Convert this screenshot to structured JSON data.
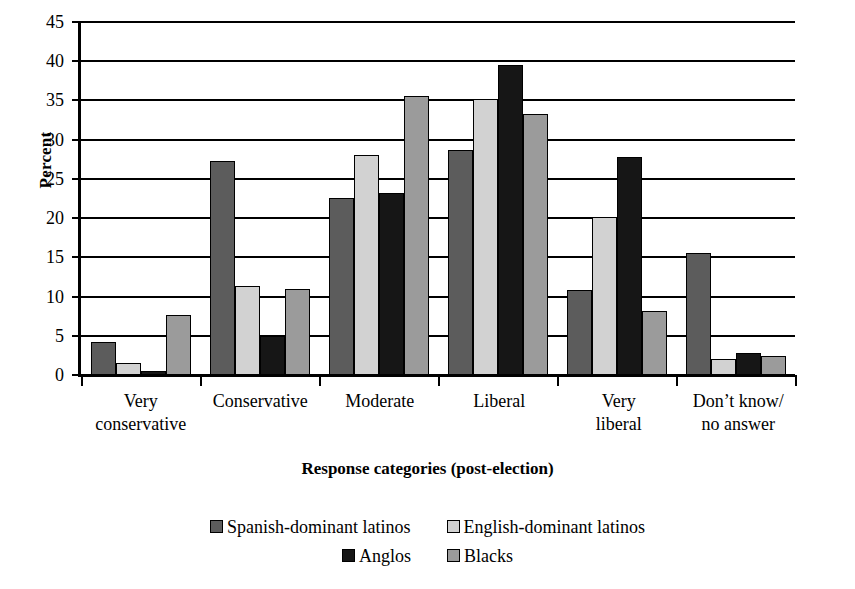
{
  "chart_data": {
    "type": "bar",
    "title": "",
    "xlabel": "Response categories (post-election)",
    "ylabel": "Percent",
    "ylim": [
      0,
      45
    ],
    "ytick_step": 5,
    "yticks": [
      45,
      40,
      35,
      30,
      25,
      20,
      15,
      10,
      5,
      0
    ],
    "grid": true,
    "legend_position": "bottom",
    "categories": [
      "Very\nconservative",
      "Conservative",
      "Moderate",
      "Liberal",
      "Very\nliberal",
      "Don’t know/\nno answer"
    ],
    "category_lines": [
      [
        "Very",
        "conservative"
      ],
      [
        "Conservative",
        ""
      ],
      [
        "Moderate",
        ""
      ],
      [
        "Liberal",
        ""
      ],
      [
        "Very",
        "liberal"
      ],
      [
        "Don’t know/",
        "no answer"
      ]
    ],
    "series": [
      {
        "name": "Spanish-dominant latinos",
        "color": "#5c5c5c",
        "values": [
          4.2,
          27.3,
          22.6,
          28.7,
          10.9,
          15.6
        ]
      },
      {
        "name": "English-dominant latinos",
        "color": "#d2d2d2",
        "values": [
          1.5,
          11.4,
          28.1,
          35.2,
          20.1,
          2.1
        ]
      },
      {
        "name": "Anglos",
        "color": "#161616",
        "values": [
          0.5,
          5.0,
          23.2,
          39.5,
          27.8,
          2.8
        ]
      },
      {
        "name": "Blacks",
        "color": "#9b9b9b",
        "values": [
          7.7,
          11.0,
          35.6,
          33.3,
          8.2,
          2.4
        ]
      }
    ]
  },
  "axis": {
    "y_title": "Percent",
    "x_title": "Response categories (post-election)"
  }
}
